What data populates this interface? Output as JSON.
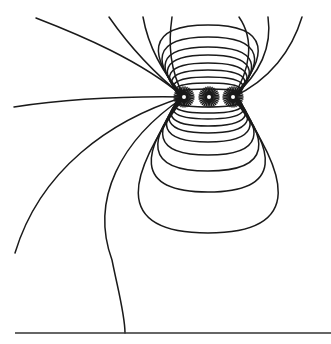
{
  "figure": {
    "title": "",
    "colors": {
      "line": "#1a1a1a",
      "background": "#ffffff",
      "baseline": "#333333"
    },
    "baseline": {
      "x1": 15,
      "y1": 333,
      "x2": 331,
      "y2": 333
    },
    "charges": [
      {
        "x": 184,
        "y": 97
      },
      {
        "x": 209,
        "y": 97
      },
      {
        "x": 233,
        "y": 97
      }
    ],
    "open_lines": [
      "M184,97 C140,60 80,35 36,18",
      "M184,97 C120,96 60,100 14,107",
      "M184,97 C110,120 40,170 15,253",
      "M184,97 C120,140 90,200 112,260 C118,290 125,315 125,333",
      "M184,97 C150,70 125,40 109,17",
      "M184,97 C160,70 148,45 143,17",
      "M184,97 C170,70 168,45 172,17",
      "M233,97 C250,70 255,40 239,17",
      "M233,97 C262,72 272,45 268,17",
      "M233,97 C270,80 292,50 302,17"
    ],
    "top_loops_ry": [
      8,
      14,
      20,
      27,
      34,
      42,
      50,
      60,
      72
    ],
    "bottom_loops_ry": [
      10,
      16,
      22,
      29,
      36,
      45,
      58,
      74,
      95,
      136
    ],
    "loop_center_x": 208,
    "loop_center_y": 97
  }
}
